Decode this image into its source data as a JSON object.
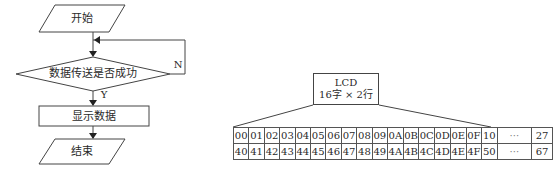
{
  "flowchart": {
    "start": "开始",
    "decision": "数据传送是否成功",
    "yes_label": "Y",
    "no_label": "N",
    "process": "显示数据",
    "end": "结束"
  },
  "lcd": {
    "title": "LCD",
    "spec": "16字 × 2行"
  },
  "address_table": {
    "rows": [
      [
        "00",
        "01",
        "02",
        "03",
        "04",
        "05",
        "06",
        "07",
        "08",
        "09",
        "0A",
        "0B",
        "0C",
        "0D",
        "0E",
        "0F",
        "10",
        "···",
        "27"
      ],
      [
        "40",
        "41",
        "42",
        "43",
        "44",
        "45",
        "46",
        "47",
        "48",
        "49",
        "4A",
        "4B",
        "4C",
        "4D",
        "4E",
        "4F",
        "50",
        "···",
        "67"
      ]
    ]
  }
}
